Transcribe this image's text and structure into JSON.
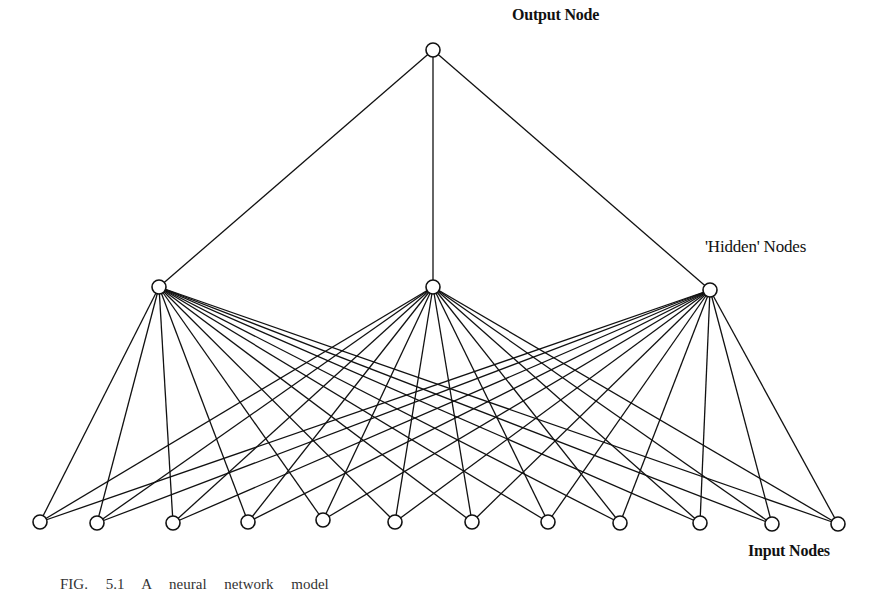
{
  "labels": {
    "output": "Output Node",
    "hidden": "'Hidden' Nodes",
    "input": "Input Nodes"
  },
  "caption": "FIG. 5.1 A neural network model",
  "colors": {
    "stroke": "#111111",
    "background": "#ffffff",
    "node_fill": "#ffffff"
  },
  "network": {
    "node_radius": 7,
    "output_nodes": [
      {
        "x": 433,
        "y": 50
      }
    ],
    "hidden_nodes": [
      {
        "x": 159,
        "y": 287
      },
      {
        "x": 433,
        "y": 287
      },
      {
        "x": 710,
        "y": 290
      }
    ],
    "input_nodes": [
      {
        "x": 40,
        "y": 522
      },
      {
        "x": 97,
        "y": 523
      },
      {
        "x": 173,
        "y": 523
      },
      {
        "x": 248,
        "y": 522
      },
      {
        "x": 323,
        "y": 520
      },
      {
        "x": 395,
        "y": 522
      },
      {
        "x": 472,
        "y": 522
      },
      {
        "x": 548,
        "y": 522
      },
      {
        "x": 620,
        "y": 523
      },
      {
        "x": 700,
        "y": 523
      },
      {
        "x": 772,
        "y": 524
      },
      {
        "x": 838,
        "y": 524
      }
    ],
    "layers": [
      "Input Nodes",
      "'Hidden' Nodes",
      "Output Node"
    ],
    "counts": {
      "input": 12,
      "hidden": 3,
      "output": 1
    }
  }
}
